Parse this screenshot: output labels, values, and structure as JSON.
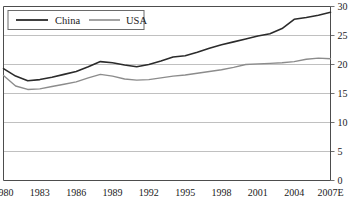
{
  "chart_data": {
    "type": "line",
    "title": "",
    "subtitle": "",
    "xlabel": "",
    "ylabel": "",
    "xlim": [
      1980,
      2007
    ],
    "ylim": [
      0,
      30
    ],
    "grid": true,
    "grid_axis": "y",
    "legend_position": "top-left",
    "x": [
      1980,
      1981,
      1982,
      1983,
      1984,
      1985,
      1986,
      1987,
      1988,
      1989,
      1990,
      1991,
      1992,
      1993,
      1994,
      1995,
      1996,
      1997,
      1998,
      1999,
      2000,
      2001,
      2002,
      2003,
      2004,
      2005,
      2006,
      2007
    ],
    "xtick_labels": [
      "1980",
      "1983",
      "1986",
      "1989",
      "1992",
      "1995",
      "1998",
      "2001",
      "2004",
      "2007E"
    ],
    "xtick_values": [
      1980,
      1983,
      1986,
      1989,
      1992,
      1995,
      1998,
      2001,
      2004,
      2007
    ],
    "ytick_labels": [
      "0",
      "5",
      "10",
      "15",
      "20",
      "25",
      "30"
    ],
    "ytick_values": [
      0,
      5,
      10,
      15,
      20,
      25,
      30
    ],
    "series": [
      {
        "name": "China",
        "color": "#2b2b2b",
        "width": 1.6,
        "values": [
          19.3,
          18.0,
          17.2,
          17.4,
          17.8,
          18.3,
          18.8,
          19.6,
          20.5,
          20.3,
          19.9,
          19.6,
          20.0,
          20.6,
          21.3,
          21.5,
          22.1,
          22.8,
          23.4,
          23.9,
          24.4,
          24.9,
          25.3,
          26.2,
          27.8,
          28.1,
          28.5,
          29.0
        ]
      },
      {
        "name": "USA",
        "color": "#8c8c8c",
        "width": 1.4,
        "values": [
          18.1,
          16.3,
          15.7,
          15.8,
          16.2,
          16.6,
          17.0,
          17.7,
          18.3,
          18.0,
          17.5,
          17.3,
          17.4,
          17.7,
          18.0,
          18.2,
          18.5,
          18.8,
          19.1,
          19.5,
          20.0,
          20.1,
          20.2,
          20.3,
          20.5,
          20.9,
          21.1,
          21.0
        ]
      }
    ]
  },
  "legend": {
    "entries": [
      {
        "label": "China"
      },
      {
        "label": "USA"
      }
    ]
  },
  "axis": {
    "y_right_labels": [
      "30",
      "25",
      "20",
      "15",
      "10",
      "5",
      "0"
    ],
    "x_labels": [
      "1980",
      "1983",
      "1986",
      "1989",
      "1992",
      "1995",
      "1998",
      "2001",
      "2004",
      "2007E"
    ]
  },
  "colors": {
    "china_line": "#2b2b2b",
    "usa_line": "#8c8c8c",
    "grid": "#b0b0b0",
    "axis": "#4d4d4d",
    "text": "#1a1a1a",
    "background": "#ffffff"
  }
}
